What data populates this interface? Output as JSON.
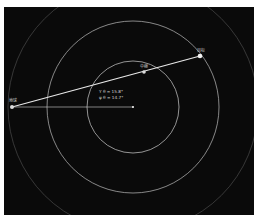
{
  "diagram": {
    "background": "#0a0a0a",
    "center": {
      "x": 133,
      "y": 107
    },
    "rings": [
      {
        "name": "inner-orbit",
        "r": 46,
        "color": "#cfcfcf"
      },
      {
        "name": "middle-orbit",
        "r": 86,
        "color": "#bdbdbd"
      },
      {
        "name": "outer-orbit",
        "r": 125,
        "color": "#4a4a4a"
      }
    ],
    "nodes": [
      {
        "id": "left",
        "label": "地球",
        "x": 12,
        "y": 107
      },
      {
        "id": "middle",
        "label": "中继",
        "x": 144,
        "y": 72
      },
      {
        "id": "right",
        "label": "目标",
        "x": 200,
        "y": 56
      }
    ],
    "angles": {
      "line1": "Y θ = 15.8°",
      "line2": "ψ θ = 14.7°"
    }
  }
}
